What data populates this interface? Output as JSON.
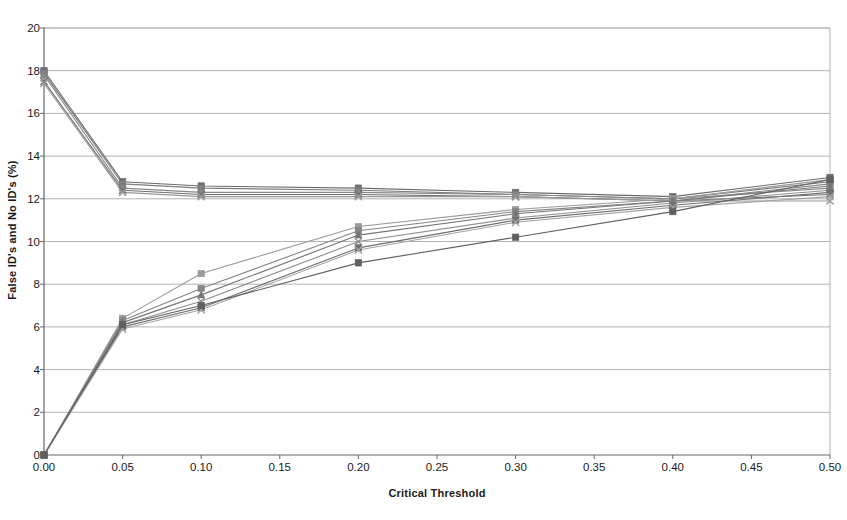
{
  "chart_data": {
    "type": "line",
    "title": "",
    "subtitle": "",
    "xlabel": "Critical Threshold",
    "ylabel": "False ID's and No ID's (%)",
    "xlim": [
      0.0,
      0.5
    ],
    "ylim": [
      0,
      20
    ],
    "xticks": [
      0.0,
      0.05,
      0.1,
      0.15,
      0.2,
      0.25,
      0.3,
      0.35,
      0.4,
      0.45,
      0.5
    ],
    "xticklabels": [
      "0.00",
      "0.05",
      "0.10",
      "0.15",
      "0.20",
      "0.25",
      "0.30",
      "0.35",
      "0.40",
      "0.45",
      "0.50"
    ],
    "yticks": [
      0,
      2,
      4,
      6,
      8,
      10,
      12,
      14,
      16,
      18,
      20
    ],
    "yticklabels": [
      "0",
      "2",
      "4",
      "6",
      "8",
      "10",
      "12",
      "14",
      "16",
      "18",
      "20"
    ],
    "grid": "horizontal",
    "legend": "none",
    "annotations": [],
    "x": [
      0.0,
      0.05,
      0.1,
      0.2,
      0.3,
      0.4,
      0.5
    ],
    "series": [
      {
        "name": "No ID's series 1",
        "marker": "square",
        "color": "#6b6b6b",
        "x": [
          0.0,
          0.05,
          0.1,
          0.2,
          0.3,
          0.4,
          0.5
        ],
        "values": [
          18.0,
          12.8,
          12.6,
          12.5,
          12.3,
          12.1,
          13.0
        ]
      },
      {
        "name": "No ID's series 2",
        "marker": "square",
        "color": "#7d7d7d",
        "x": [
          0.0,
          0.05,
          0.1,
          0.2,
          0.3,
          0.4,
          0.5
        ],
        "values": [
          17.9,
          12.7,
          12.5,
          12.4,
          12.2,
          12.0,
          12.8
        ]
      },
      {
        "name": "No ID's series 3",
        "marker": "triangle",
        "color": "#888888",
        "x": [
          0.0,
          0.05,
          0.1,
          0.2,
          0.3,
          0.4,
          0.5
        ],
        "values": [
          17.8,
          12.5,
          12.3,
          12.3,
          12.2,
          12.0,
          12.5
        ]
      },
      {
        "name": "No ID's series 4",
        "marker": "cross",
        "color": "#707070",
        "x": [
          0.0,
          0.05,
          0.1,
          0.2,
          0.3,
          0.4,
          0.5
        ],
        "values": [
          17.5,
          12.4,
          12.2,
          12.2,
          12.1,
          11.9,
          12.2
        ]
      },
      {
        "name": "No ID's series 5",
        "marker": "cross",
        "color": "#999999",
        "x": [
          0.0,
          0.05,
          0.1,
          0.2,
          0.3,
          0.4,
          0.5
        ],
        "values": [
          17.4,
          12.3,
          12.1,
          12.1,
          12.1,
          11.9,
          11.9
        ]
      },
      {
        "name": "False ID's series 1",
        "marker": "square",
        "color": "#9a9a9a",
        "x": [
          0.0,
          0.05,
          0.1,
          0.2,
          0.3,
          0.4,
          0.5
        ],
        "values": [
          0.0,
          6.4,
          8.5,
          10.7,
          11.5,
          12.0,
          12.9
        ]
      },
      {
        "name": "False ID's series 2",
        "marker": "square",
        "color": "#868686",
        "x": [
          0.0,
          0.05,
          0.1,
          0.2,
          0.3,
          0.4,
          0.5
        ],
        "values": [
          0.0,
          6.3,
          7.8,
          10.5,
          11.4,
          11.9,
          12.7
        ]
      },
      {
        "name": "False ID's series 3",
        "marker": "triangle",
        "color": "#757575",
        "x": [
          0.0,
          0.05,
          0.1,
          0.2,
          0.3,
          0.4,
          0.5
        ],
        "values": [
          0.0,
          6.2,
          7.5,
          10.3,
          11.3,
          11.9,
          12.6
        ]
      },
      {
        "name": "False ID's series 4",
        "marker": "cross",
        "color": "#8e8e8e",
        "x": [
          0.0,
          0.05,
          0.1,
          0.2,
          0.3,
          0.4,
          0.5
        ],
        "values": [
          0.0,
          6.1,
          7.2,
          10.0,
          11.1,
          11.8,
          12.4
        ]
      },
      {
        "name": "False ID's series 5",
        "marker": "square",
        "color": "#6e6e6e",
        "x": [
          0.0,
          0.05,
          0.1,
          0.2,
          0.3,
          0.4,
          0.5
        ],
        "values": [
          0.0,
          6.0,
          6.9,
          9.7,
          11.0,
          11.7,
          12.3
        ]
      },
      {
        "name": "False ID's series 6",
        "marker": "cross",
        "color": "#a3a3a3",
        "x": [
          0.0,
          0.05,
          0.1,
          0.2,
          0.3,
          0.4,
          0.5
        ],
        "values": [
          0.0,
          5.9,
          6.8,
          9.6,
          10.9,
          11.6,
          12.1
        ]
      },
      {
        "name": "False ID's series 7",
        "marker": "square",
        "color": "#5f5f5f",
        "x": [
          0.0,
          0.05,
          0.1,
          0.2,
          0.3,
          0.4,
          0.5
        ],
        "values": [
          0.0,
          6.1,
          7.0,
          9.0,
          10.2,
          11.4,
          12.9
        ]
      }
    ]
  },
  "plot": {
    "axis_color": "#808080",
    "grid_color": "#b3b3b3",
    "background": "#ffffff"
  }
}
